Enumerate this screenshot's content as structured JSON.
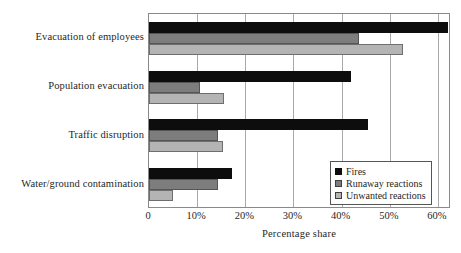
{
  "chart_data": {
    "type": "bar",
    "orientation": "horizontal",
    "title": "",
    "xlabel": "Percentage share",
    "ylabel": "",
    "xlim": [
      0,
      62.7
    ],
    "xticks": [
      0,
      10,
      20,
      30,
      40,
      50,
      60
    ],
    "xticklabels": [
      "0",
      "10%",
      "20%",
      "30%",
      "40%",
      "50%",
      "60%"
    ],
    "grid": "vertical",
    "legend_position": "lower-right",
    "categories": [
      "Evacuation of employees",
      "Population evacuation",
      "Traffic disruption",
      "Water/ground contamination"
    ],
    "series": [
      {
        "name": "Fires",
        "color": "#0d0d0d",
        "values": [
          62.0,
          42.0,
          45.5,
          17.3
        ]
      },
      {
        "name": "Runaway reactions",
        "color": "#7d7d7d",
        "values": [
          43.5,
          10.5,
          14.3,
          14.3
        ]
      },
      {
        "name": "Unwanted reactions",
        "color": "#b4b4b4",
        "values": [
          52.8,
          15.5,
          15.3,
          5.0
        ]
      }
    ]
  }
}
